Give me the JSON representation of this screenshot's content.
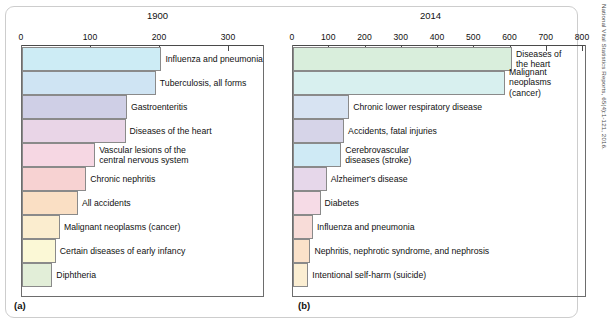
{
  "source_credit": "National Vital Statistics Reports, 65(4):1-121, 2016.",
  "panels": [
    {
      "caption": "(a)",
      "title": "1900",
      "axis": {
        "ticks": [
          "0",
          "100",
          "200",
          "300"
        ],
        "min": 0,
        "max": 340
      },
      "bars": [
        {
          "label": "Influenza and pneumonia",
          "value": 202,
          "color": "#cdecf5"
        },
        {
          "label": "Tuberculosis, all forms",
          "value": 194,
          "color": "#cfe4f3"
        },
        {
          "label": "Gastroenteritis",
          "value": 152,
          "color": "#cfcfe6"
        },
        {
          "label": "Diseases of the heart",
          "value": 150,
          "color": "#e9d5e7"
        },
        {
          "label": "Vascular lesions of the\ncentral nervous system",
          "value": 106,
          "color": "#f6d7e3"
        },
        {
          "label": "Chronic nephritis",
          "value": 93,
          "color": "#f7d2d2"
        },
        {
          "label": "All accidents",
          "value": 81,
          "color": "#fadfc4"
        },
        {
          "label": "Malignant neoplasms (cancer)",
          "value": 55,
          "color": "#fbedcf"
        },
        {
          "label": "Certain diseases of early infancy",
          "value": 49,
          "color": "#fbf8d6"
        },
        {
          "label": "Diphtheria",
          "value": 44,
          "color": "#e2eed8"
        }
      ]
    },
    {
      "caption": "(b)",
      "title": "2014",
      "axis": {
        "ticks": [
          "0",
          "100",
          "200",
          "300",
          "400",
          "500",
          "600",
          "700",
          "800"
        ],
        "min": 0,
        "max": 800
      },
      "bars": [
        {
          "label": "Diseases of\nthe heart",
          "value": 604,
          "color": "#d9eedc"
        },
        {
          "label": "Malignant\nneoplasms\n(cancer)",
          "value": 585,
          "color": "#d8f0ef"
        },
        {
          "label": "Chronic lower respiratory disease",
          "value": 155,
          "color": "#d7e3f2"
        },
        {
          "label": "Accidents, fatal injuries",
          "value": 141,
          "color": "#d6d4e8"
        },
        {
          "label": "Cerebrovascular\ndiseases (stroke)",
          "value": 133,
          "color": "#cfeaf5"
        },
        {
          "label": "Alzheimer's disease",
          "value": 93,
          "color": "#e6d7ea"
        },
        {
          "label": "Diabetes",
          "value": 76,
          "color": "#f6dbe6"
        },
        {
          "label": "Influenza and pneumonia",
          "value": 55,
          "color": "#f8dcd8"
        },
        {
          "label": "Nephritis, nephrotic syndrome, and nephrosis",
          "value": 48,
          "color": "#fae1c9"
        },
        {
          "label": "Intentional self-harm (suicide)",
          "value": 42,
          "color": "#fbeed2"
        }
      ]
    }
  ],
  "chart_data": {
    "type": "bar",
    "orientation": "horizontal",
    "xlabel": "Deaths per 100,000 population",
    "ylabel": "",
    "grid": false,
    "legend": "none",
    "panels": [
      {
        "name": "1900",
        "xlim": [
          0,
          340
        ],
        "xticks": [
          0,
          100,
          200,
          300
        ],
        "categories": [
          "Influenza and pneumonia",
          "Tuberculosis, all forms",
          "Gastroenteritis",
          "Diseases of the heart",
          "Vascular lesions of the central nervous system",
          "Chronic nephritis",
          "All accidents",
          "Malignant neoplasms (cancer)",
          "Certain diseases of early infancy",
          "Diphtheria"
        ],
        "values": [
          202,
          194,
          152,
          150,
          106,
          93,
          81,
          55,
          49,
          44
        ]
      },
      {
        "name": "2014",
        "xlim": [
          0,
          800
        ],
        "xticks": [
          0,
          100,
          200,
          300,
          400,
          500,
          600,
          700,
          800
        ],
        "categories": [
          "Diseases of the heart",
          "Malignant neoplasms (cancer)",
          "Chronic lower respiratory disease",
          "Accidents, fatal injuries",
          "Cerebrovascular diseases (stroke)",
          "Alzheimer's disease",
          "Diabetes",
          "Influenza and pneumonia",
          "Nephritis, nephrotic syndrome, and nephrosis",
          "Intentional self-harm (suicide)"
        ],
        "values": [
          604,
          585,
          155,
          141,
          133,
          93,
          76,
          55,
          48,
          42
        ]
      }
    ]
  }
}
